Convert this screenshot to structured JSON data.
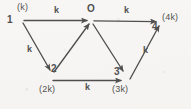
{
  "figure": {
    "kind": "directed-graph-diagram",
    "background_color": "#f7f6f4",
    "stroke_color": "#2b2b2b",
    "width": 191,
    "height": 109
  },
  "nodes": [
    {
      "key": "n1",
      "id": "1",
      "capacity": "(k)",
      "x": 22,
      "y": 21
    },
    {
      "key": "nO",
      "id": "O",
      "capacity": "",
      "x": 91,
      "y": 21
    },
    {
      "key": "n4",
      "id": "4",
      "capacity": "(4k)",
      "x": 160,
      "y": 22
    },
    {
      "key": "n2",
      "id": "2",
      "capacity": "(2k)",
      "x": 52,
      "y": 75
    },
    {
      "key": "n3",
      "id": "3",
      "capacity": "(3k)",
      "x": 124,
      "y": 76
    }
  ],
  "edges": [
    {
      "key": "e1O",
      "from": "1",
      "to": "O",
      "weight": "k"
    },
    {
      "key": "eO4",
      "from": "O",
      "to": "4",
      "weight": "k"
    },
    {
      "key": "e12",
      "from": "1",
      "to": "2",
      "weight": "k"
    },
    {
      "key": "e2O",
      "from": "2",
      "to": "O",
      "weight": ""
    },
    {
      "key": "eO3",
      "from": "O",
      "to": "3",
      "weight": ""
    },
    {
      "key": "e23",
      "from": "2",
      "to": "3",
      "weight": "k"
    },
    {
      "key": "e34",
      "from": "3",
      "to": "4",
      "weight": "k"
    }
  ],
  "labels": {
    "node_1_id": "1",
    "node_1_cap": "(k)",
    "node_O_id": "O",
    "node_4_id": "4",
    "node_4_cap": "(4k)",
    "node_2_id": "2",
    "node_2_cap": "(2k)",
    "node_3_id": "3",
    "node_3_cap": "(3k)",
    "weight_top_left": "k",
    "weight_top_right": "k",
    "weight_left_down": "k",
    "weight_bottom": "k",
    "weight_right_up": "k"
  }
}
